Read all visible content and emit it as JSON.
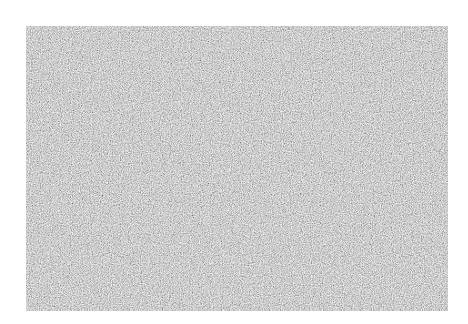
{
  "image": {
    "description": "Rectangular field of gray static noise on a white background",
    "background_color": "#ffffff",
    "panel": {
      "x": 26,
      "y": 26,
      "width": 422,
      "height": 285,
      "base_color": "#a9a9a9",
      "texture": "random grayscale noise"
    }
  }
}
